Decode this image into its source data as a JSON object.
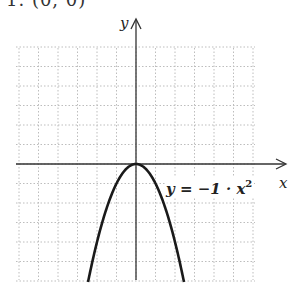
{
  "header": {
    "text": "1. (0, 0)"
  },
  "chart_data": {
    "type": "line",
    "title": "",
    "function": "y = -1 · x^2",
    "xlabel": "x",
    "ylabel": "y",
    "xlim": [
      -6,
      6
    ],
    "ylim": [
      -6,
      6
    ],
    "grid": true,
    "grid_step": 1,
    "vertex": [
      0,
      0
    ],
    "annotation": "y = −1 · x²",
    "series": [
      {
        "name": "y = -1·x^2",
        "x": [
          -2.4,
          -2,
          -1.5,
          -1,
          -0.5,
          0,
          0.5,
          1,
          1.5,
          2,
          2.4
        ],
        "y": [
          -5.76,
          -4,
          -2.25,
          -1,
          -0.25,
          0,
          -0.25,
          -1,
          -2.25,
          -4,
          -5.76
        ]
      }
    ]
  },
  "labels": {
    "x_axis": "x",
    "y_axis": "y",
    "equation_main": "y = −1 · x",
    "equation_exp": "2"
  },
  "colors": {
    "grid": "#b8b8b8",
    "axis": "#333333",
    "curve": "#1a1a1a"
  }
}
